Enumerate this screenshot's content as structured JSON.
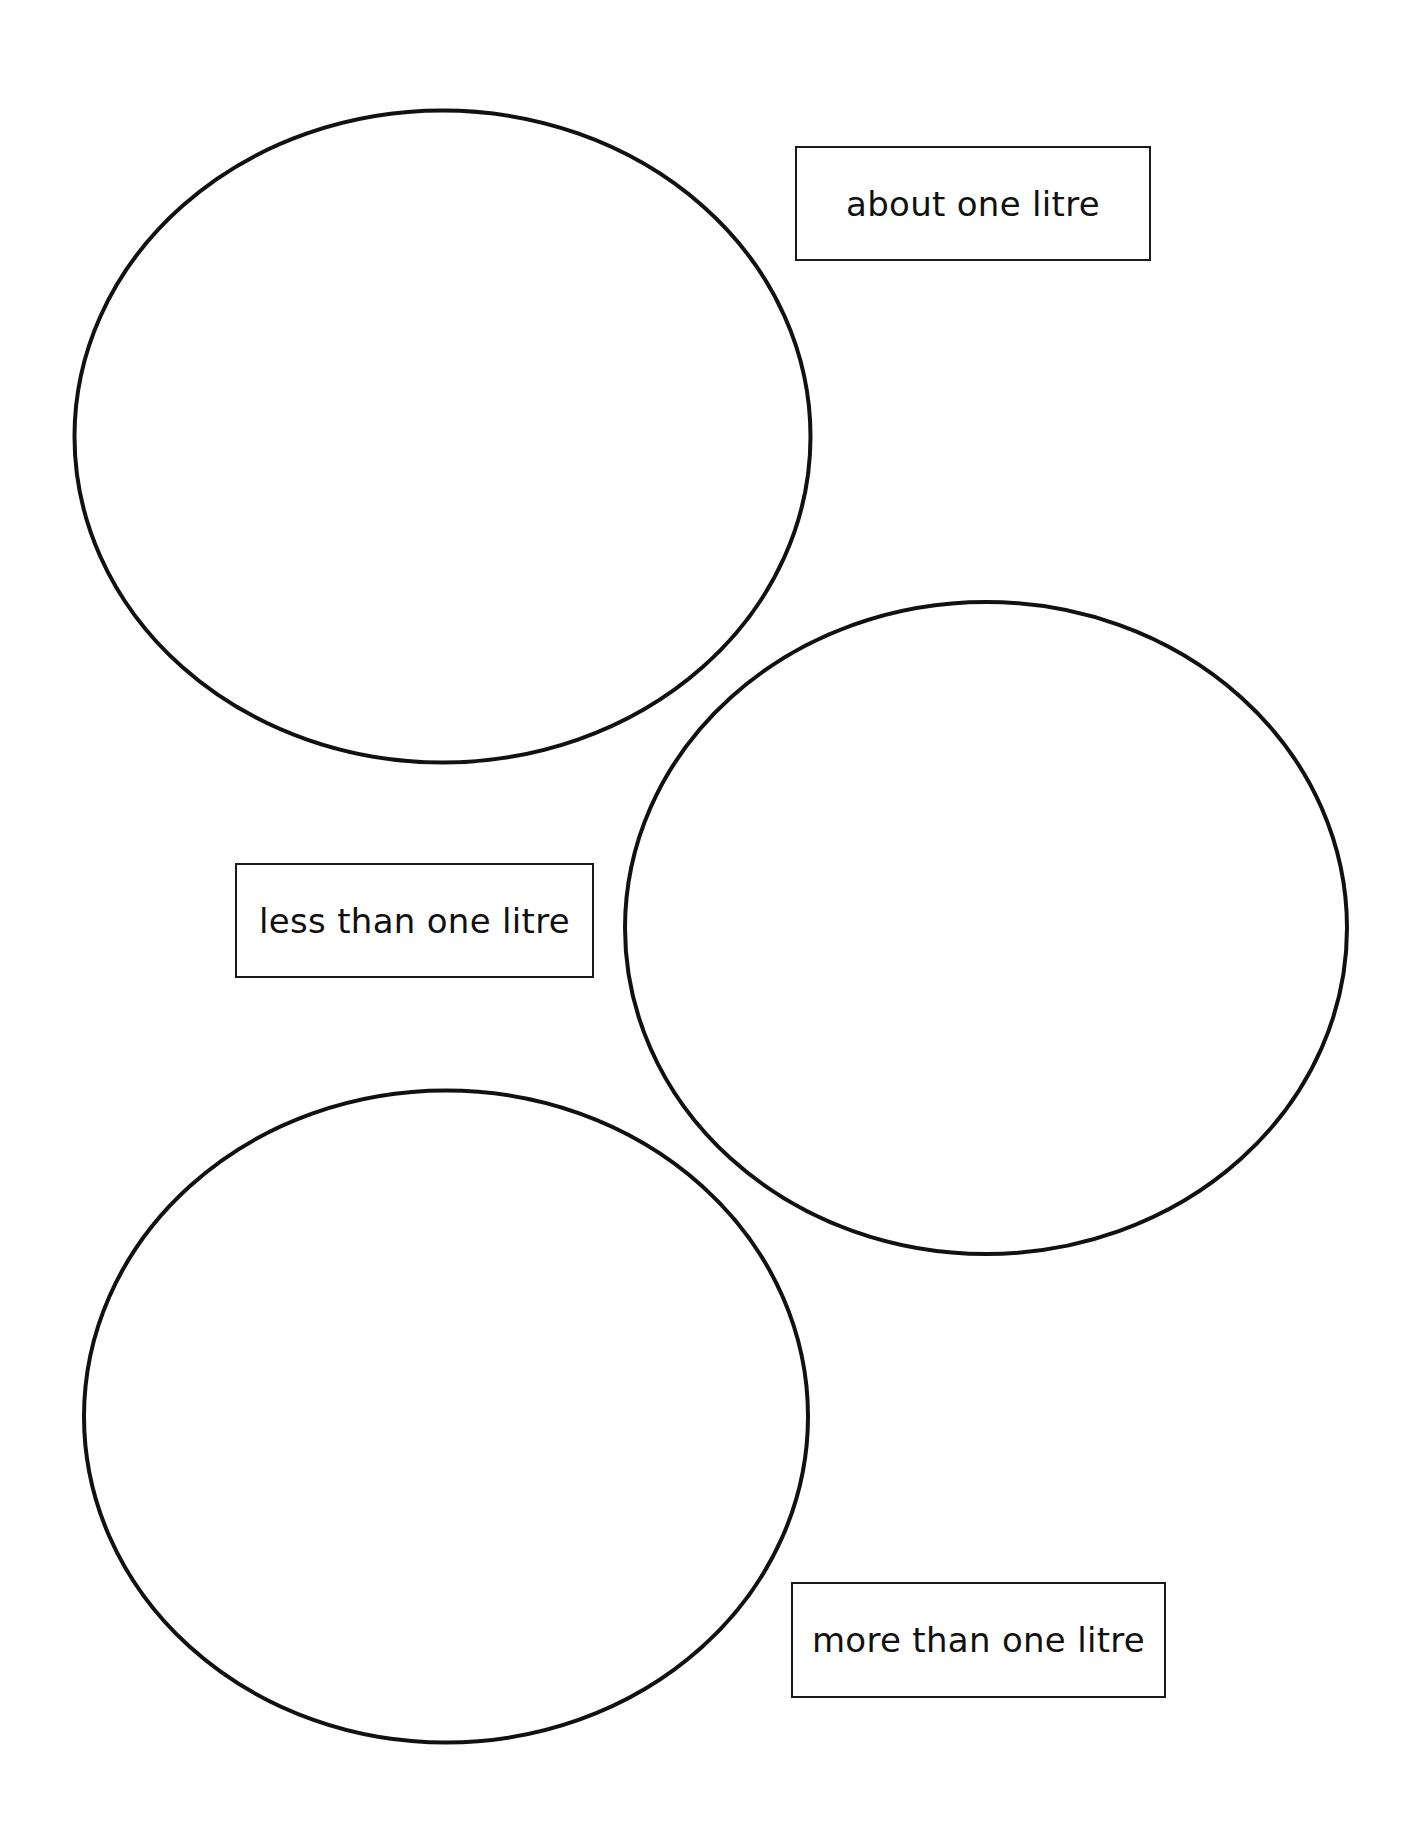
{
  "worksheet": {
    "sorting_circles": [
      {
        "id": "circle-1",
        "label": ""
      },
      {
        "id": "circle-2",
        "label": ""
      },
      {
        "id": "circle-3",
        "label": ""
      }
    ],
    "labels": [
      {
        "text": "about one litre"
      },
      {
        "text": "less than one litre"
      },
      {
        "text": "more than one litre"
      }
    ],
    "colors": {
      "stroke": "#111111",
      "background": "#ffffff"
    }
  }
}
